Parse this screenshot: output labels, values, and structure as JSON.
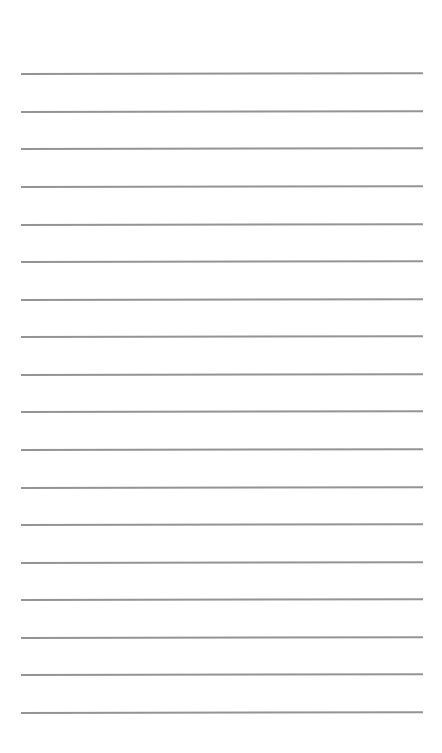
{
  "page": {
    "type": "lined-paper",
    "background_color": "#ffffff",
    "line_color": "#8e8e8e",
    "line_count": 18,
    "line_left": 21,
    "line_right": 423,
    "lines": [
      {
        "y": 73
      },
      {
        "y": 111
      },
      {
        "y": 148
      },
      {
        "y": 186
      },
      {
        "y": 224
      },
      {
        "y": 261
      },
      {
        "y": 299
      },
      {
        "y": 336
      },
      {
        "y": 374
      },
      {
        "y": 411
      },
      {
        "y": 449
      },
      {
        "y": 487
      },
      {
        "y": 524
      },
      {
        "y": 562
      },
      {
        "y": 599
      },
      {
        "y": 637
      },
      {
        "y": 674
      },
      {
        "y": 712
      }
    ]
  }
}
